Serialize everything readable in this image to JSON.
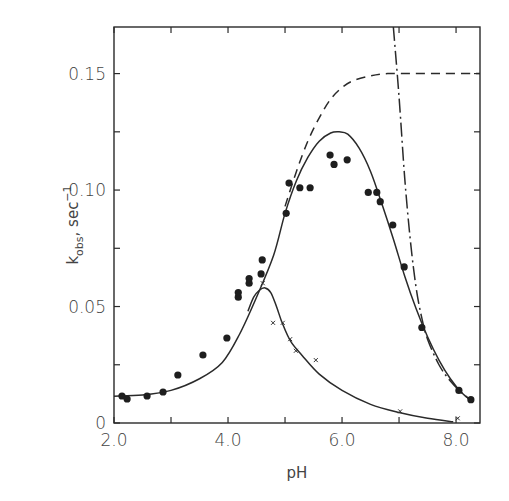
{
  "chart_data": {
    "type": "scatter",
    "title": "",
    "xlabel": "pH",
    "ylabel": "k_obs, sec^-1",
    "ylabel_parts": {
      "main": "k",
      "sub": "obs",
      "unit": ", sec",
      "sup": "−1"
    },
    "xlim": [
      2.0,
      8.42
    ],
    "ylim": [
      0,
      0.17
    ],
    "x_ticks": [
      2.0,
      3.0,
      4.0,
      5.0,
      6.0,
      7.0,
      8.0
    ],
    "x_tick_labels": [
      "2.0",
      "",
      "4.0",
      "",
      "6.0",
      "",
      "8.0"
    ],
    "y_ticks": [
      0,
      0.025,
      0.05,
      0.075,
      0.1,
      0.125,
      0.15
    ],
    "y_tick_labels": [
      "0",
      "",
      "0.05",
      "",
      "0.10",
      "",
      "0.15"
    ],
    "grid": false,
    "legend": null,
    "series": [
      {
        "name": "filled circles",
        "marker": "circle",
        "points": [
          [
            2.14,
            0.0116
          ],
          [
            2.23,
            0.0103
          ],
          [
            2.58,
            0.0116
          ],
          [
            2.86,
            0.0133
          ],
          [
            3.12,
            0.0206
          ],
          [
            3.56,
            0.0292
          ],
          [
            3.98,
            0.0365
          ],
          [
            4.18,
            0.054
          ],
          [
            4.18,
            0.056
          ],
          [
            4.37,
            0.06
          ],
          [
            4.37,
            0.062
          ],
          [
            4.58,
            0.064
          ],
          [
            4.6,
            0.07
          ],
          [
            5.02,
            0.09
          ],
          [
            5.07,
            0.103
          ],
          [
            5.26,
            0.101
          ],
          [
            5.44,
            0.101
          ],
          [
            5.79,
            0.115
          ],
          [
            5.86,
            0.111
          ],
          [
            6.09,
            0.113
          ],
          [
            6.46,
            0.099
          ],
          [
            6.61,
            0.099
          ],
          [
            6.67,
            0.095
          ],
          [
            6.89,
            0.085
          ],
          [
            7.09,
            0.067
          ],
          [
            7.4,
            0.041
          ],
          [
            8.05,
            0.014
          ],
          [
            8.26,
            0.01
          ]
        ]
      },
      {
        "name": "x markers",
        "marker": "x",
        "points": [
          [
            4.61,
            0.06
          ],
          [
            4.79,
            0.043
          ],
          [
            4.96,
            0.043
          ],
          [
            5.09,
            0.036
          ],
          [
            5.19,
            0.031
          ],
          [
            5.54,
            0.027
          ],
          [
            7.02,
            0.005
          ],
          [
            8.03,
            0.002
          ]
        ]
      },
      {
        "name": "solid bell curve",
        "style": "solid",
        "points": [
          [
            2.0,
            0.0115
          ],
          [
            2.5,
            0.012
          ],
          [
            3.0,
            0.014
          ],
          [
            3.5,
            0.019
          ],
          [
            3.9,
            0.026
          ],
          [
            4.2,
            0.038
          ],
          [
            4.5,
            0.054
          ],
          [
            4.8,
            0.072
          ],
          [
            5.0,
            0.09
          ],
          [
            5.2,
            0.104
          ],
          [
            5.4,
            0.114
          ],
          [
            5.6,
            0.121
          ],
          [
            5.8,
            0.1245
          ],
          [
            5.95,
            0.125
          ],
          [
            6.1,
            0.124
          ],
          [
            6.3,
            0.118
          ],
          [
            6.5,
            0.108
          ],
          [
            6.7,
            0.094
          ],
          [
            6.9,
            0.079
          ],
          [
            7.1,
            0.063
          ],
          [
            7.3,
            0.049
          ],
          [
            7.5,
            0.037
          ],
          [
            7.7,
            0.027
          ],
          [
            7.9,
            0.019
          ],
          [
            8.1,
            0.013
          ],
          [
            8.3,
            0.009
          ]
        ]
      },
      {
        "name": "solid lower curve",
        "style": "solid",
        "points": [
          [
            4.35,
            0.048
          ],
          [
            4.45,
            0.054
          ],
          [
            4.55,
            0.057
          ],
          [
            4.65,
            0.058
          ],
          [
            4.75,
            0.056
          ],
          [
            4.85,
            0.05
          ],
          [
            4.95,
            0.043
          ],
          [
            5.1,
            0.035
          ],
          [
            5.3,
            0.029
          ],
          [
            5.6,
            0.021
          ],
          [
            6.0,
            0.014
          ],
          [
            6.5,
            0.008
          ],
          [
            7.0,
            0.0045
          ],
          [
            7.5,
            0.002
          ],
          [
            7.95,
            0.0005
          ]
        ]
      },
      {
        "name": "dashed curve",
        "style": "dashed",
        "points": [
          [
            5.0,
            0.093
          ],
          [
            5.2,
            0.108
          ],
          [
            5.4,
            0.121
          ],
          [
            5.6,
            0.131
          ],
          [
            5.8,
            0.139
          ],
          [
            6.0,
            0.144
          ],
          [
            6.2,
            0.147
          ],
          [
            6.5,
            0.149
          ],
          [
            6.8,
            0.15
          ],
          [
            7.2,
            0.15
          ],
          [
            7.8,
            0.15
          ],
          [
            8.42,
            0.15
          ]
        ]
      },
      {
        "name": "dash-dot curve",
        "style": "dash-dot",
        "points": [
          [
            6.9,
            0.17
          ],
          [
            7.0,
            0.14
          ],
          [
            7.1,
            0.105
          ],
          [
            7.2,
            0.078
          ],
          [
            7.3,
            0.058
          ],
          [
            7.4,
            0.045
          ],
          [
            7.5,
            0.036
          ],
          [
            7.7,
            0.025
          ],
          [
            7.9,
            0.018
          ],
          [
            8.1,
            0.013
          ],
          [
            8.3,
            0.009
          ]
        ]
      }
    ],
    "plot_area_px": {
      "left": 114,
      "right": 480,
      "top": 27,
      "bottom": 423
    }
  }
}
